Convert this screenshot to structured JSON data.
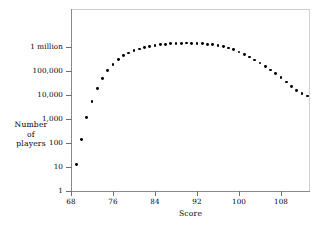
{
  "chart_data": {
    "type": "scatter",
    "title": "",
    "xlabel": "Score",
    "ylabel": "Number of players",
    "ylabel_lines": [
      "Number",
      "of",
      "players"
    ],
    "xlim": [
      67,
      115
    ],
    "ylim": [
      1,
      10000000
    ],
    "yscale": "log",
    "xscale": "linear",
    "grid": false,
    "legend": null,
    "xticks": [
      68,
      76,
      84,
      92,
      100,
      108
    ],
    "xtick_labels": [
      "68",
      "76",
      "84",
      "92",
      "100",
      "108"
    ],
    "yticks": [
      1,
      10,
      100,
      1000,
      10000,
      100000,
      1000000,
      10000000
    ],
    "ytick_labels": [
      "1",
      "10",
      "100",
      "1,000",
      "10,000",
      "100,000",
      "1 million",
      ""
    ],
    "point_color": "#000000",
    "axis_color": "#8a8a8a",
    "frame_color": "#cfcfcf",
    "x": [
      69,
      70,
      71,
      72,
      73,
      74,
      75,
      76,
      77,
      78,
      79,
      80,
      81,
      82,
      83,
      84,
      85,
      86,
      87,
      88,
      89,
      90,
      91,
      92,
      93,
      94,
      95,
      96,
      97,
      98,
      99,
      100,
      101,
      102,
      103,
      104,
      105,
      106,
      107,
      108,
      109,
      110,
      111,
      112,
      113,
      114
    ],
    "y": [
      13,
      135,
      1150,
      5200,
      18000,
      48000,
      105000,
      190000,
      300000,
      430000,
      560000,
      700000,
      830000,
      960000,
      1060000,
      1160000,
      1250000,
      1320000,
      1380000,
      1420000,
      1450000,
      1460000,
      1450000,
      1430000,
      1380000,
      1320000,
      1240000,
      1140000,
      1020000,
      900000,
      760000,
      620000,
      490000,
      380000,
      290000,
      215000,
      155000,
      110000,
      76000,
      52000,
      35000,
      23000,
      15500,
      11500,
      9000,
      7800
    ]
  },
  "yticks_px": [
    {
      "label": "1 million",
      "top": 47
    },
    {
      "label": "100,000",
      "top": 71
    },
    {
      "label": "10,000",
      "top": 95
    },
    {
      "label": "1,000",
      "top": 119
    },
    {
      "label": "100",
      "top": 143
    },
    {
      "label": "10",
      "top": 167
    },
    {
      "label": "1",
      "top": 191
    }
  ]
}
